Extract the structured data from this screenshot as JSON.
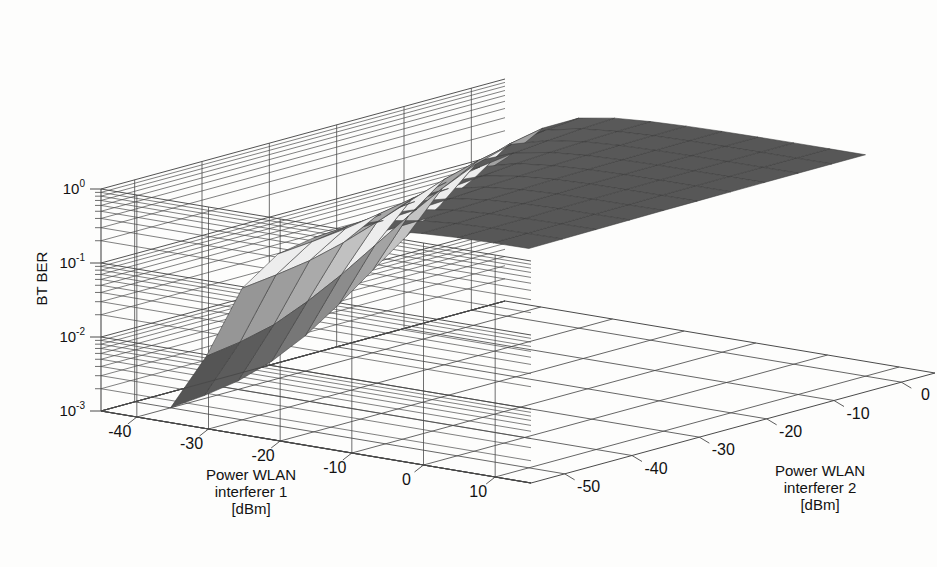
{
  "figure": {
    "background_color": "#fdfdfc",
    "line_color": "#4a4a4a",
    "text_color": "#121212"
  },
  "chart_data": {
    "type": "surface",
    "title": "",
    "xlabel": "Power WLAN interferer 1 [dBm]",
    "ylabel": "Power WLAN interferer 2 [dBm]",
    "zlabel": "BT BER",
    "xlabel_lines": [
      "Power WLAN",
      "interferer 1",
      "[dBm]"
    ],
    "ylabel_lines": [
      "Power WLAN",
      "interferer 2",
      "[dBm]"
    ],
    "zscale": "log",
    "zlim": [
      0.001,
      1.0
    ],
    "xlim": [
      -45,
      15
    ],
    "ylim": [
      -55,
      5
    ],
    "grid": true,
    "legend": "none",
    "xticks": [
      -40,
      -30,
      -20,
      -10,
      0,
      10
    ],
    "xticklabels": [
      "-40",
      "-30",
      "-20",
      "-10",
      "0",
      "10"
    ],
    "yticks": [
      -50,
      -40,
      -30,
      -20,
      -10,
      0
    ],
    "yticklabels": [
      "-50",
      "-40",
      "-30",
      "-20",
      "-10",
      "0"
    ],
    "zticks": [
      1,
      0.1,
      0.01,
      0.001
    ],
    "zticklabels": [
      {
        "mantissa": "10",
        "exponent": "0"
      },
      {
        "mantissa": "10",
        "exponent": "-1"
      },
      {
        "mantissa": "10",
        "exponent": "-2"
      },
      {
        "mantissa": "10",
        "exponent": "-3"
      }
    ],
    "x": [
      -40,
      -35,
      -30,
      -25,
      -20,
      -15,
      -10,
      -5,
      0,
      5,
      10
    ],
    "y": [
      -50,
      -45,
      -40,
      -35,
      -30,
      -25,
      -20,
      -15,
      -10,
      -5,
      0
    ],
    "z_comment": "BT BER as function of WLAN interferer 1 (x) and interferer 2 (y); rows indexed by y, columns by x",
    "z": [
      [
        0.001,
        0.006,
        0.06,
        0.21,
        0.42,
        0.62,
        0.76,
        0.84,
        0.89,
        0.91,
        0.92
      ],
      [
        0.0011,
        0.007,
        0.068,
        0.23,
        0.45,
        0.65,
        0.78,
        0.86,
        0.9,
        0.92,
        0.93
      ],
      [
        0.0013,
        0.009,
        0.08,
        0.26,
        0.49,
        0.69,
        0.81,
        0.88,
        0.91,
        0.93,
        0.94
      ],
      [
        0.0018,
        0.014,
        0.105,
        0.31,
        0.55,
        0.73,
        0.84,
        0.9,
        0.93,
        0.94,
        0.95
      ],
      [
        0.003,
        0.024,
        0.15,
        0.38,
        0.62,
        0.78,
        0.87,
        0.92,
        0.94,
        0.95,
        0.96
      ],
      [
        0.006,
        0.045,
        0.22,
        0.47,
        0.69,
        0.82,
        0.9,
        0.94,
        0.95,
        0.96,
        0.965
      ],
      [
        0.013,
        0.085,
        0.32,
        0.57,
        0.76,
        0.86,
        0.92,
        0.95,
        0.96,
        0.965,
        0.97
      ],
      [
        0.028,
        0.15,
        0.43,
        0.66,
        0.81,
        0.89,
        0.935,
        0.958,
        0.965,
        0.97,
        0.975
      ],
      [
        0.055,
        0.24,
        0.54,
        0.73,
        0.85,
        0.915,
        0.945,
        0.962,
        0.97,
        0.975,
        0.978
      ],
      [
        0.095,
        0.34,
        0.63,
        0.79,
        0.88,
        0.93,
        0.955,
        0.968,
        0.974,
        0.978,
        0.98
      ],
      [
        0.14,
        0.42,
        0.69,
        0.83,
        0.9,
        0.94,
        0.962,
        0.972,
        0.978,
        0.98,
        0.982
      ]
    ],
    "shading": {
      "colormap": "grayscale",
      "facet_edge_color": "#3a3a3a",
      "light_color": "#e6e6e6",
      "dark_color": "#2a2a2a"
    }
  }
}
